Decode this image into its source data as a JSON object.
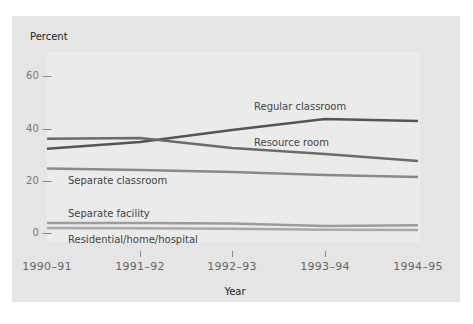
{
  "chart_data": {
    "type": "line",
    "title": "",
    "ylabel": "Percent",
    "xlabel": "Year",
    "ylim": [
      0,
      60
    ],
    "yticks": [
      0,
      20,
      40,
      60
    ],
    "categories": [
      "1990-91",
      "1991-92",
      "1992-93",
      "1993-94",
      "1994-95"
    ],
    "grid": false,
    "legend": "inline labels",
    "series": [
      {
        "name": "Regular classroom",
        "values": [
          32.5,
          35.0,
          39.6,
          43.8,
          43.0
        ],
        "color": "#555555"
      },
      {
        "name": "Resource room",
        "values": [
          36.3,
          36.6,
          32.8,
          30.5,
          27.8
        ],
        "color": "#6b6b6b"
      },
      {
        "name": "Separate classroom",
        "values": [
          25.0,
          24.4,
          23.6,
          22.5,
          21.7
        ],
        "color": "#8a8a8a"
      },
      {
        "name": "Separate facility",
        "values": [
          4.2,
          4.2,
          4.0,
          3.0,
          3.3
        ],
        "color": "#9c9c9c"
      },
      {
        "name": "Residential/home/hospital",
        "values": [
          2.3,
          2.2,
          2.0,
          1.6,
          1.5
        ],
        "color": "#a8a8a8"
      }
    ]
  },
  "labels": {
    "ylabel": "Percent",
    "xlabel": "Year",
    "yticks": [
      "60 —",
      "40 —",
      "20 —",
      "0 —"
    ],
    "xticks": [
      "1990–91",
      "1991–92",
      "1992–93",
      "1993–94",
      "1994–95"
    ],
    "series": [
      "Regular classroom",
      "Resource room",
      "Separate classroom",
      "Separate facility",
      "Residential/home/hospital"
    ]
  }
}
